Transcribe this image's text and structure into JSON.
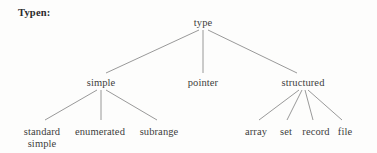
{
  "title": "Typen:",
  "canvas": {
    "width": 377,
    "height": 153,
    "background": "#fdfdfc",
    "edge_color": "#8d8d8d",
    "text_color": "#3d3d3d"
  },
  "chart_data": {
    "type": "diagram",
    "subtype": "tree",
    "title": "Typen:",
    "orientation": "top-down",
    "nodes": [
      {
        "id": "type",
        "label": "type",
        "level": 0,
        "x": 203,
        "y": 17
      },
      {
        "id": "simple",
        "label": "simple",
        "level": 1,
        "x": 101,
        "y": 77
      },
      {
        "id": "pointer",
        "label": "pointer",
        "level": 1,
        "x": 203,
        "y": 77
      },
      {
        "id": "structured",
        "label": "structured",
        "level": 1,
        "x": 303,
        "y": 77
      },
      {
        "id": "standard",
        "label": "standard",
        "label2": "simple",
        "level": 2,
        "x": 42,
        "y": 126
      },
      {
        "id": "enumerated",
        "label": "enumerated",
        "level": 2,
        "x": 100,
        "y": 126
      },
      {
        "id": "subrange",
        "label": "subrange",
        "level": 2,
        "x": 159,
        "y": 126
      },
      {
        "id": "array",
        "label": "array",
        "level": 2,
        "x": 256,
        "y": 126
      },
      {
        "id": "set",
        "label": "set",
        "level": 2,
        "x": 286,
        "y": 126
      },
      {
        "id": "record",
        "label": "record",
        "level": 2,
        "x": 316,
        "y": 126
      },
      {
        "id": "file",
        "label": "file",
        "level": 2,
        "x": 345,
        "y": 126
      }
    ],
    "edges": [
      {
        "from": "type",
        "to": "simple",
        "x1": 199,
        "y1": 30,
        "x2": 106,
        "y2": 73
      },
      {
        "from": "type",
        "to": "pointer",
        "x1": 203,
        "y1": 30,
        "x2": 203,
        "y2": 73
      },
      {
        "from": "type",
        "to": "structured",
        "x1": 208,
        "y1": 30,
        "x2": 297,
        "y2": 73
      },
      {
        "from": "simple",
        "to": "standard",
        "x1": 97,
        "y1": 90,
        "x2": 45,
        "y2": 120
      },
      {
        "from": "simple",
        "to": "enumerated",
        "x1": 101,
        "y1": 90,
        "x2": 101,
        "y2": 120
      },
      {
        "from": "simple",
        "to": "subrange",
        "x1": 106,
        "y1": 90,
        "x2": 157,
        "y2": 120
      },
      {
        "from": "structured",
        "to": "array",
        "x1": 299,
        "y1": 90,
        "x2": 259,
        "y2": 120
      },
      {
        "from": "structured",
        "to": "set",
        "x1": 302,
        "y1": 90,
        "x2": 287,
        "y2": 120
      },
      {
        "from": "structured",
        "to": "record",
        "x1": 305,
        "y1": 90,
        "x2": 313,
        "y2": 120
      },
      {
        "from": "structured",
        "to": "file",
        "x1": 308,
        "y1": 90,
        "x2": 342,
        "y2": 120
      }
    ]
  }
}
